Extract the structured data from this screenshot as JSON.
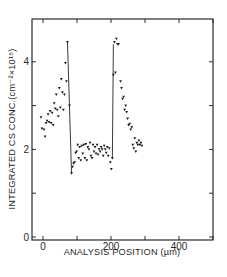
{
  "chart_data": {
    "type": "scatter",
    "title": "",
    "xlabel": "ANALYSIS POSITION (µm)",
    "ylabel": "INTEGRATED CS CONC.(cm⁻²×10¹⁵)",
    "xlim": [
      -32,
      500
    ],
    "ylim": [
      0,
      5.0
    ],
    "xticks": [
      0,
      100,
      200,
      300,
      400,
      500
    ],
    "xtick_labels": [
      "0",
      "",
      "200",
      "",
      "400",
      ""
    ],
    "yticks": [
      0,
      1,
      2,
      3,
      4
    ],
    "ytick_labels": [
      "0",
      "",
      "2",
      "",
      "4"
    ],
    "grid": false,
    "legend": null,
    "marker": "inverted-triangle",
    "color": "#1a1a1a",
    "series": [
      {
        "name": "measured",
        "points": [
          [
            -6,
            2.73
          ],
          [
            -3,
            2.47
          ],
          [
            3,
            2.45
          ],
          [
            6,
            2.29
          ],
          [
            9,
            2.6
          ],
          [
            12,
            2.65
          ],
          [
            15,
            2.8
          ],
          [
            18,
            2.62
          ],
          [
            21,
            2.87
          ],
          [
            24,
            2.6
          ],
          [
            27,
            2.83
          ],
          [
            30,
            2.55
          ],
          [
            33,
            3.05
          ],
          [
            36,
            2.93
          ],
          [
            39,
            3.25
          ],
          [
            42,
            2.9
          ],
          [
            45,
            2.75
          ],
          [
            48,
            3.4
          ],
          [
            51,
            2.95
          ],
          [
            54,
            3.6
          ],
          [
            57,
            3.3
          ],
          [
            60,
            2.9
          ],
          [
            63,
            3.25
          ],
          [
            66,
            3.97
          ],
          [
            69,
            3.55
          ],
          [
            72,
            4.45
          ],
          [
            78,
            3.0
          ],
          [
            84,
            1.45
          ],
          [
            87,
            1.6
          ],
          [
            90,
            1.68
          ],
          [
            93,
            1.7
          ],
          [
            96,
            1.92
          ],
          [
            99,
            1.95
          ],
          [
            102,
            2.1
          ],
          [
            105,
            1.8
          ],
          [
            108,
            2.05
          ],
          [
            111,
            1.75
          ],
          [
            114,
            2.08
          ],
          [
            117,
            1.9
          ],
          [
            120,
            2.1
          ],
          [
            123,
            1.8
          ],
          [
            126,
            2.12
          ],
          [
            129,
            1.75
          ],
          [
            132,
            2.05
          ],
          [
            135,
            2.0
          ],
          [
            138,
            2.15
          ],
          [
            141,
            1.85
          ],
          [
            144,
            1.8
          ],
          [
            147,
            2.1
          ],
          [
            150,
            1.95
          ],
          [
            153,
            2.05
          ],
          [
            156,
            1.9
          ],
          [
            159,
            2.1
          ],
          [
            162,
            1.88
          ],
          [
            165,
            2.0
          ],
          [
            168,
            1.95
          ],
          [
            171,
            2.05
          ],
          [
            174,
            2.0
          ],
          [
            177,
            1.85
          ],
          [
            180,
            2.08
          ],
          [
            183,
            2.0
          ],
          [
            186,
            1.92
          ],
          [
            189,
            2.05
          ],
          [
            192,
            1.85
          ],
          [
            195,
            2.02
          ],
          [
            198,
            1.7
          ],
          [
            201,
            1.55
          ],
          [
            204,
            1.8
          ],
          [
            207,
            3.7
          ],
          [
            210,
            4.45
          ],
          [
            213,
            3.75
          ],
          [
            216,
            4.52
          ],
          [
            219,
            4.4
          ],
          [
            222,
            4.4
          ],
          [
            228,
            3.55
          ],
          [
            231,
            3.4
          ],
          [
            234,
            3.15
          ],
          [
            237,
            3.2
          ],
          [
            240,
            2.9
          ],
          [
            243,
            3.0
          ],
          [
            246,
            2.85
          ],
          [
            249,
            2.7
          ],
          [
            252,
            2.55
          ],
          [
            255,
            2.58
          ],
          [
            258,
            2.45
          ],
          [
            261,
            2.5
          ],
          [
            264,
            2.1
          ],
          [
            267,
            2.02
          ],
          [
            270,
            2.25
          ],
          [
            273,
            1.95
          ],
          [
            276,
            2.15
          ],
          [
            279,
            2.1
          ],
          [
            282,
            2.2
          ],
          [
            285,
            2.1
          ],
          [
            288,
            2.15
          ],
          [
            291,
            2.08
          ]
        ]
      }
    ],
    "lines": [
      {
        "from": [
          72,
          4.45
        ],
        "to": [
          84,
          1.45
        ]
      },
      {
        "from": [
          204,
          1.8
        ],
        "to": [
          207,
          4.4
        ]
      }
    ]
  }
}
